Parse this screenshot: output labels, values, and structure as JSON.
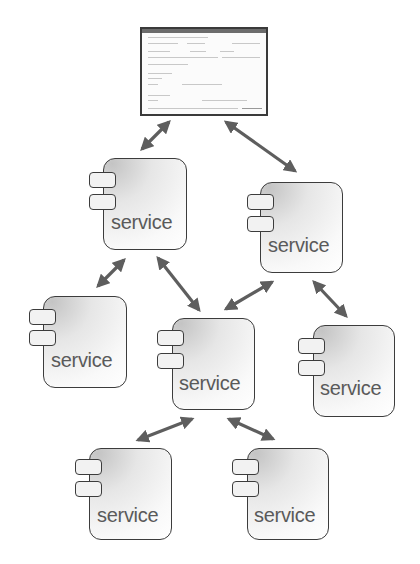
{
  "diagram": {
    "type": "service-architecture",
    "client_window": {
      "name": "application-screenshot",
      "text_legible": false
    },
    "services": [
      {
        "id": "s1",
        "label": "service"
      },
      {
        "id": "s2",
        "label": "service"
      },
      {
        "id": "s3",
        "label": "service"
      },
      {
        "id": "s4",
        "label": "service"
      },
      {
        "id": "s5",
        "label": "service"
      },
      {
        "id": "s6",
        "label": "service"
      },
      {
        "id": "s7",
        "label": "service"
      }
    ],
    "connections": [
      {
        "from": "client",
        "to": "s1",
        "bidirectional": true
      },
      {
        "from": "client",
        "to": "s2",
        "bidirectional": true
      },
      {
        "from": "s1",
        "to": "s3",
        "bidirectional": true
      },
      {
        "from": "s1",
        "to": "s4",
        "bidirectional": true
      },
      {
        "from": "s2",
        "to": "s4",
        "bidirectional": true
      },
      {
        "from": "s2",
        "to": "s5",
        "bidirectional": true
      },
      {
        "from": "s4",
        "to": "s6",
        "bidirectional": true
      },
      {
        "from": "s4",
        "to": "s7",
        "bidirectional": true
      }
    ],
    "colors": {
      "arrow": "#5e5e5e",
      "border": "#3c3c3c",
      "label": "#5a5a5a"
    }
  }
}
